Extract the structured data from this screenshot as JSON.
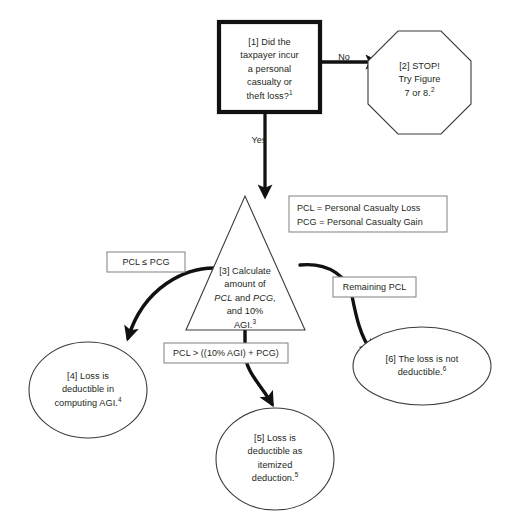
{
  "diagram": {
    "type": "flowchart",
    "background_color": "#ffffff",
    "line_color": "#111111",
    "thin_line_color": "#3b3b3b",
    "label_border_color": "#8b8b8b",
    "text_color": "#231f20"
  },
  "nodes": {
    "n1": {
      "id": "[1]",
      "shape": "rectangle-bold",
      "line1": "[1]  Did the",
      "line2": "taxpayer incur",
      "line3": "a personal",
      "line4": "casualty or",
      "line5": "theft loss?",
      "footnote": "1"
    },
    "n2": {
      "id": "[2]",
      "shape": "octagon",
      "line1": "[2] STOP!",
      "line2": "Try Figure",
      "line3": "7 or 8.",
      "footnote": "2"
    },
    "n3": {
      "id": "[3]",
      "shape": "triangle",
      "line1": "[3] Calculate",
      "line2": "amount of",
      "line3_a": "PCL",
      "line3_b": " and ",
      "line3_c": "PCG",
      "line3_d": ",",
      "line4": "and 10%",
      "line5": "AGI.",
      "footnote": "3"
    },
    "n4": {
      "id": "[4]",
      "shape": "ellipse",
      "line1": "[4] Loss is",
      "line2": "deductible in",
      "line3": "computing AGI.",
      "footnote": "4"
    },
    "n5": {
      "id": "[5]",
      "shape": "ellipse",
      "line1": "[5] Loss is",
      "line2": "deductible as",
      "line3": "itemized",
      "line4": "deduction.",
      "footnote": "5"
    },
    "n6": {
      "id": "[6]",
      "shape": "ellipse",
      "line1": "[6] The loss is not",
      "line2": "deductible.",
      "footnote": "6"
    }
  },
  "edges": {
    "e_no": {
      "from": "[1]",
      "to": "[2]",
      "label": "No"
    },
    "e_yes": {
      "from": "[1]",
      "to": "[3]",
      "label": "Yes"
    },
    "e_left": {
      "from": "[3]",
      "to": "[4]",
      "label": "PCL ≤  PCG"
    },
    "e_center": {
      "from": "[3]",
      "to": "[5]",
      "label": "PCL  > ((10% AGI) + PCG)"
    },
    "e_right": {
      "from": "[3]",
      "to": "[6]",
      "label": "Remaining PCL"
    }
  },
  "legend": {
    "line1": "PCL =  Personal Casualty Loss",
    "line2": "PCG = Personal Casualty Gain"
  }
}
